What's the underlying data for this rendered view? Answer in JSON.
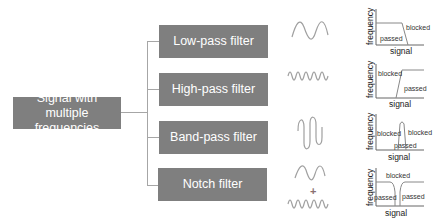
{
  "source": {
    "label": "Signal with multiple frequencies"
  },
  "filters": [
    {
      "label": "Low-pass filter",
      "response": {
        "passed": "passed",
        "blocked": "blocked"
      }
    },
    {
      "label": "High-pass filter",
      "response": {
        "passed": "passed",
        "blocked": "blocked"
      }
    },
    {
      "label": "Band-pass filter",
      "response": {
        "passed": "passed",
        "blocked_left": "blocked",
        "blocked_right": "blocked"
      }
    },
    {
      "label": "Notch filter",
      "response": {
        "passed_left": "passed",
        "passed_right": "passed",
        "blocked": "blocked"
      }
    }
  ],
  "axes": {
    "y_label": "frequency",
    "x_label": "signal"
  },
  "notch_combine_symbol": "+",
  "colors": {
    "box": "#7f7f7f",
    "box_text": "#ffffff",
    "connector": "#a6a6a6",
    "wave": "#a0a0a0"
  }
}
